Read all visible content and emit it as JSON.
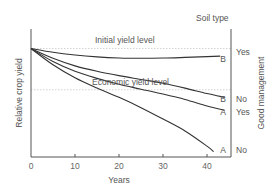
{
  "chart_data": {
    "type": "line",
    "title": "",
    "xlabel": "Years",
    "ylabel": "Relative crop yield",
    "right_axis_label": "Good management",
    "right_header": "Soil type",
    "xlim": [
      0,
      45
    ],
    "ylim": [
      0,
      118
    ],
    "x_ticks": [
      0,
      10,
      20,
      30,
      40
    ],
    "y_ticks": [],
    "grid": false,
    "reference_lines": [
      {
        "name": "initial",
        "label": "Initial yield level",
        "value": 100
      },
      {
        "name": "economic",
        "label": "Economic yield level",
        "value": 62
      }
    ],
    "series": [
      {
        "name": "Soil B, good management",
        "soil": "B",
        "management": "Yes",
        "x": [
          0,
          5,
          10,
          15,
          20,
          25,
          30,
          35,
          40,
          43
        ],
        "values": [
          100,
          96.5,
          94,
          92.3,
          91.3,
          91,
          91.2,
          91.8,
          92.5,
          93
        ]
      },
      {
        "name": "Soil B, poor management",
        "soil": "B",
        "management": "No",
        "x": [
          0,
          5,
          10,
          15,
          20,
          25,
          30,
          35,
          40,
          44
        ],
        "values": [
          100,
          91,
          84,
          79,
          75,
          71.5,
          68,
          63.5,
          58.5,
          55
        ]
      },
      {
        "name": "Soil A, good management",
        "soil": "A",
        "management": "Yes",
        "x": [
          0,
          5,
          10,
          15,
          20,
          25,
          30,
          35,
          40,
          44
        ],
        "values": [
          100,
          88,
          79,
          72.5,
          67,
          62.5,
          58,
          53,
          47,
          43
        ]
      },
      {
        "name": "Soil A, poor management",
        "soil": "A",
        "management": "No",
        "x": [
          0,
          5,
          10,
          15,
          20,
          25,
          30,
          35,
          40,
          41.5
        ],
        "values": [
          100,
          85,
          73,
          63.5,
          55,
          45.5,
          35,
          24,
          10,
          5
        ]
      }
    ],
    "end_labels": [
      {
        "soil": "B",
        "management": "Yes"
      },
      {
        "soil": "B",
        "management": "No"
      },
      {
        "soil": "A",
        "management": "Yes"
      },
      {
        "soil": "A",
        "management": "No"
      }
    ]
  }
}
